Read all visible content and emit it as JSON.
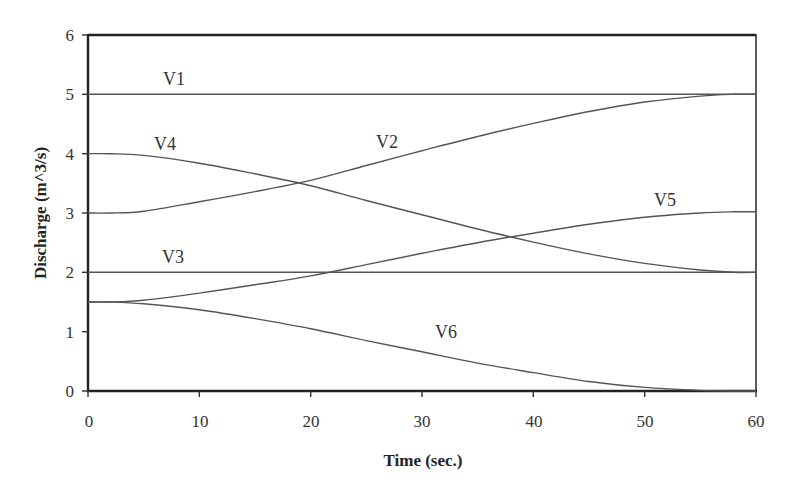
{
  "chart_data": {
    "type": "line",
    "title": "",
    "xlabel": "Time (sec.)",
    "ylabel": "Discharge (m^3/s)",
    "xlim": [
      0,
      60
    ],
    "ylim": [
      0,
      6
    ],
    "xticks": [
      0,
      10,
      20,
      30,
      40,
      50,
      60
    ],
    "yticks": [
      0,
      1,
      2,
      3,
      4,
      5,
      6
    ],
    "grid": false,
    "legend": "inline labels",
    "x": [
      0,
      2,
      5,
      10,
      15,
      20,
      25,
      30,
      35,
      40,
      45,
      50,
      55,
      58,
      60
    ],
    "series": [
      {
        "name": "V1",
        "values": [
          5,
          5,
          5,
          5,
          5,
          5,
          5,
          5,
          5,
          5,
          5,
          5,
          5,
          5,
          5
        ],
        "label_pos": [
          7,
          5.15
        ]
      },
      {
        "name": "V2",
        "values": [
          3,
          3,
          3.03,
          3.19,
          3.36,
          3.55,
          3.8,
          4.05,
          4.29,
          4.51,
          4.71,
          4.87,
          4.97,
          5,
          5
        ],
        "label_pos": [
          27,
          4.2
        ]
      },
      {
        "name": "V3",
        "values": [
          2,
          2,
          2,
          2,
          2,
          2,
          2,
          2,
          2,
          2,
          2,
          2,
          2,
          2,
          2
        ],
        "label_pos": [
          8,
          2.15
        ]
      },
      {
        "name": "V4",
        "values": [
          4,
          4,
          3.97,
          3.84,
          3.66,
          3.46,
          3.21,
          2.97,
          2.73,
          2.51,
          2.31,
          2.15,
          2.04,
          2,
          2
        ],
        "label_pos": [
          7,
          4.15
        ]
      },
      {
        "name": "V5",
        "values": [
          1.5,
          1.5,
          1.53,
          1.65,
          1.79,
          1.94,
          2.13,
          2.32,
          2.5,
          2.66,
          2.81,
          2.93,
          3.0,
          3.02,
          3.02
        ],
        "label_pos": [
          52,
          3.15
        ]
      },
      {
        "name": "V6",
        "values": [
          1.5,
          1.5,
          1.47,
          1.37,
          1.22,
          1.05,
          0.85,
          0.66,
          0.47,
          0.31,
          0.16,
          0.06,
          0.01,
          0,
          0
        ],
        "label_pos": [
          35,
          0.95
        ]
      }
    ]
  },
  "axes": {
    "x_title": "Time (sec.)",
    "y_title": "Discharge (m^3/s)",
    "x_ticks": [
      "0",
      "10",
      "20",
      "30",
      "40",
      "50",
      "60"
    ],
    "y_ticks": [
      "0",
      "1",
      "2",
      "3",
      "4",
      "5",
      "6"
    ]
  },
  "labels": {
    "v1": "V1",
    "v2": "V2",
    "v3": "V3",
    "v4": "V4",
    "v5": "V5",
    "v6": "V6"
  }
}
